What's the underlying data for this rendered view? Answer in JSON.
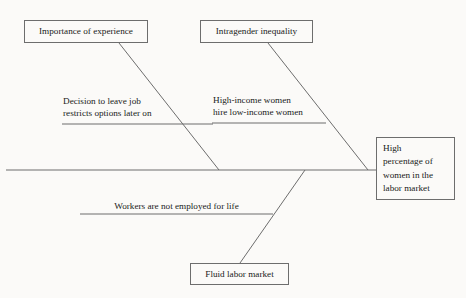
{
  "diagram": {
    "type": "fishbone",
    "title": "",
    "background_color": "#fbfaf8",
    "line_color": "#6d6d6d",
    "text_color": "#1a1a1a",
    "effect": {
      "id": "effect",
      "lines": [
        "High",
        "percentage of",
        "women in the",
        "labor market"
      ],
      "text": "High percentage of women in the labor market"
    },
    "causes": [
      {
        "id": "importance-of-experience",
        "label": "Importance of experience",
        "position": "top-left",
        "sub_cause": {
          "id": "decision-to-leave-job",
          "lines": [
            "Decision to leave job",
            "restricts options later on"
          ],
          "text": "Decision to leave job restricts options later on"
        }
      },
      {
        "id": "intragender-inequality",
        "label": "Intragender inequality",
        "position": "top-right",
        "sub_cause": {
          "id": "high-income-women",
          "lines": [
            "High-income women",
            "hire low-income women"
          ],
          "text": "High-income women hire low-income women"
        }
      },
      {
        "id": "fluid-labor-market",
        "label": "Fluid labor market",
        "position": "bottom",
        "sub_cause": {
          "id": "workers-not-employed-for-life",
          "lines": [
            "Workers are not employed for life"
          ],
          "text": "Workers are not employed for life"
        }
      }
    ]
  }
}
